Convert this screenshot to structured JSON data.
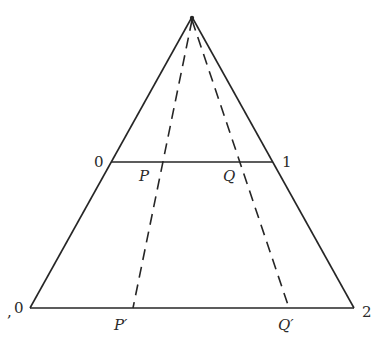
{
  "diagram": {
    "type": "projective-triangle",
    "colors": {
      "line": "#262626",
      "text": "#2a2a2a",
      "background": "#ffffff"
    },
    "apex": {
      "x": 192,
      "y": 17
    },
    "middle_line": {
      "y": 162,
      "x1": 111,
      "x2": 273,
      "left_label": "0",
      "right_label": "1",
      "points": [
        {
          "name": "P",
          "label": "P",
          "x": 163
        },
        {
          "name": "Q",
          "label": "Q",
          "x": 240
        }
      ]
    },
    "bottom_line": {
      "y": 308,
      "x1": 30,
      "x2": 354,
      "left_label": "0",
      "left_mark": ",",
      "right_label": "2",
      "points": [
        {
          "name": "P-prime",
          "label": "P′",
          "x": 133
        },
        {
          "name": "Q-prime",
          "label": "Q′",
          "x": 289
        }
      ]
    }
  }
}
